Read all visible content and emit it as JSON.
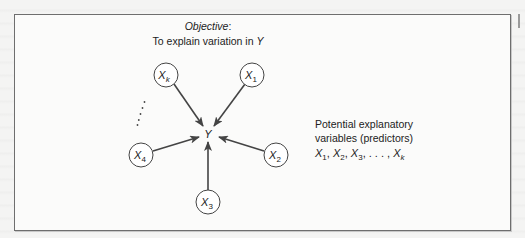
{
  "objective": {
    "label": "Objective",
    "suffix": ":",
    "line2_prefix": "To explain variation in ",
    "line2_var": "Y"
  },
  "center_node": {
    "label": "Y"
  },
  "predictor_nodes": [
    {
      "id": "xk",
      "base": "X",
      "sub": "k"
    },
    {
      "id": "x1",
      "base": "X",
      "sub": "1"
    },
    {
      "id": "x4",
      "base": "X",
      "sub": "4"
    },
    {
      "id": "x2",
      "base": "X",
      "sub": "2"
    },
    {
      "id": "x3",
      "base": "X",
      "sub": "3"
    }
  ],
  "legend": {
    "line1": "Potential explanatory",
    "line2": "variables (predictors)",
    "list": [
      {
        "base": "X",
        "sub": "1",
        "sep": ", "
      },
      {
        "base": "X",
        "sub": "2",
        "sep": ", "
      },
      {
        "base": "X",
        "sub": "3",
        "sep": ", . . . , "
      },
      {
        "base": "X",
        "sub": "k",
        "sep": ""
      }
    ]
  },
  "colors": {
    "frame": "#6e6e6e",
    "arrow": "#444444",
    "text": "#222222",
    "background": "#fbfbfa"
  }
}
